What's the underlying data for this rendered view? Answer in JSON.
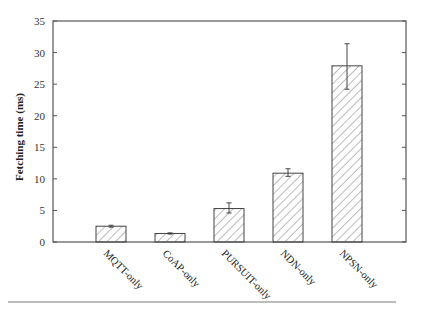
{
  "chart_data": {
    "type": "bar",
    "title": "",
    "xlabel": "",
    "ylabel": "Fetching time (ms)",
    "categories": [
      "MQTT-only",
      "CoAP-only",
      "PURSUIT-only",
      "NDN-only",
      "NPSN-only"
    ],
    "values": [
      2.5,
      1.35,
      5.3,
      10.9,
      27.9
    ],
    "error_bars": [
      {
        "low": 2.35,
        "high": 2.65
      },
      {
        "low": 1.25,
        "high": 1.45
      },
      {
        "low": 4.6,
        "high": 6.2
      },
      {
        "low": 10.4,
        "high": 11.6
      },
      {
        "low": 24.2,
        "high": 31.4
      }
    ],
    "ylim": [
      0,
      35
    ],
    "yticks": [
      0,
      5,
      10,
      15,
      20,
      25,
      30,
      35
    ],
    "ytick_labels": [
      "0",
      "5",
      "10",
      "15",
      "20",
      "25",
      "30",
      "35"
    ],
    "grid": false,
    "legend": null,
    "bar_fill": "hatched diagonal",
    "colors": {
      "bar_edge": "#444444",
      "hatch": "#777777",
      "axis": "#555555"
    }
  }
}
